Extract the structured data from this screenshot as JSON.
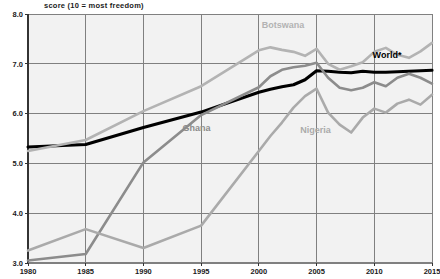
{
  "chart_data": {
    "type": "line",
    "title": "score (10 = most freedom)",
    "xlabel": "",
    "ylabel": "",
    "xlim": [
      1980,
      2015
    ],
    "ylim": [
      3.0,
      8.0
    ],
    "xticks": [
      "1980",
      "1985",
      "1990",
      "1995",
      "2000",
      "2005",
      "2010",
      "2015"
    ],
    "yticks": [
      "3.0",
      "4.0",
      "5.0",
      "6.0",
      "7.0",
      "8.0"
    ],
    "grid": true,
    "legend_position": "inline-annotations",
    "x": [
      1980,
      1985,
      1990,
      1995,
      2000,
      2001,
      2002,
      2003,
      2004,
      2005,
      2006,
      2007,
      2008,
      2009,
      2010,
      2011,
      2012,
      2013,
      2014,
      2015
    ],
    "series": [
      {
        "name": "World*",
        "color": "#000000",
        "width": 3.1,
        "label_x": 2011.1,
        "label_y": 7.12,
        "label_anchor": "middle",
        "values": [
          5.33,
          5.38,
          5.72,
          6.03,
          6.43,
          6.49,
          6.54,
          6.58,
          6.68,
          6.86,
          6.85,
          6.83,
          6.82,
          6.85,
          6.83,
          6.83,
          6.84,
          6.85,
          6.86,
          6.87
        ]
      },
      {
        "name": "Botswana",
        "color": "#b3b3b3",
        "width": 2.6,
        "label_x": 2002.1,
        "label_y": 7.72,
        "label_anchor": "middle",
        "values": [
          5.25,
          5.47,
          6.05,
          6.55,
          7.27,
          7.33,
          7.28,
          7.24,
          7.16,
          7.3,
          7.0,
          6.88,
          6.95,
          7.03,
          7.24,
          7.32,
          7.18,
          7.12,
          7.25,
          7.42
        ]
      },
      {
        "name": "Ghana",
        "color": "#8c8c8c",
        "width": 2.6,
        "label_x": 1994.6,
        "label_y": 5.66,
        "label_anchor": "middle",
        "values": [
          3.05,
          3.18,
          5.02,
          5.97,
          6.53,
          6.75,
          6.88,
          6.93,
          6.96,
          7.02,
          6.72,
          6.52,
          6.47,
          6.52,
          6.63,
          6.55,
          6.72,
          6.8,
          6.72,
          6.6
        ]
      },
      {
        "name": "Nigeria",
        "color": "#aaaaaa",
        "width": 2.6,
        "label_x": 2004.9,
        "label_y": 5.62,
        "label_anchor": "middle",
        "values": [
          3.25,
          3.68,
          3.3,
          3.75,
          5.25,
          5.55,
          5.82,
          6.12,
          6.35,
          6.5,
          6.02,
          5.78,
          5.62,
          5.92,
          6.1,
          6.02,
          6.2,
          6.28,
          6.18,
          6.38
        ]
      }
    ]
  }
}
